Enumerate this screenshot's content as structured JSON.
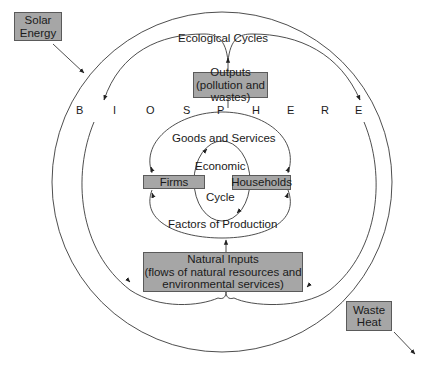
{
  "external": {
    "solar_energy": {
      "line1": "Solar",
      "line2": "Energy"
    },
    "waste_heat": {
      "line1": "Waste",
      "line2": "Heat"
    }
  },
  "biosphere": {
    "letters": [
      "B",
      "I",
      "O",
      "S",
      "P",
      "H",
      "E",
      "R",
      "E"
    ]
  },
  "ecological_cycles_label": "Ecological Cycles",
  "outputs": {
    "line1": "Outputs",
    "line2": "(pollution and wastes)"
  },
  "natural_inputs": {
    "line1": "Natural Inputs",
    "line2": "(flows of natural resources and",
    "line3": "environmental services)"
  },
  "economic_cycle": {
    "goods_and_services": "Goods and Services",
    "factors_of_production": "Factors of Production",
    "firms": "Firms",
    "households": "Households",
    "center_top": "Economic",
    "center_bottom": "Cycle"
  },
  "colors": {
    "box_fill": "#a6a6a6",
    "box_border": "#5a5a5a",
    "line": "#3a3a3a"
  }
}
